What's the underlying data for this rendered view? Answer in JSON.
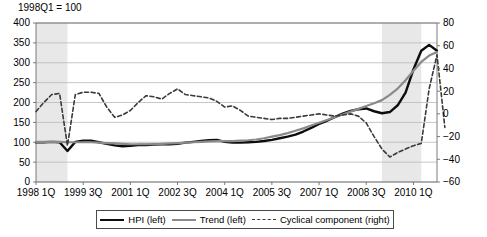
{
  "chart_data": {
    "type": "line",
    "title": "1998Q1 = 100",
    "xlabel": "",
    "ylabel": "",
    "grid": true,
    "legend_position": "bottom",
    "y_left": {
      "label": "index (1998Q1 = 100)",
      "ticks": [
        0,
        50,
        100,
        150,
        200,
        250,
        300,
        350,
        400
      ],
      "ylim": [
        0,
        400
      ]
    },
    "y_right": {
      "label": "percent deviation",
      "ticks": [
        -60,
        -40,
        -20,
        0,
        20,
        40,
        60,
        80
      ],
      "ylim": [
        -60,
        80
      ]
    },
    "x_tick_labels": [
      "1998 1Q",
      "1999 3Q",
      "2001 1Q",
      "2002 3Q",
      "2004 1Q",
      "2005 3Q",
      "2007 1Q",
      "2008 3Q",
      "2010 1Q"
    ],
    "x_tick_periods": [
      "1998Q1",
      "1999Q3",
      "2001Q1",
      "2002Q3",
      "2004Q1",
      "2005Q3",
      "2007Q1",
      "2008Q3",
      "2010Q1"
    ],
    "x_range": [
      "1998Q1",
      "2010Q4"
    ],
    "shaded_regions": [
      {
        "from": "1998Q1",
        "to": "1999Q1",
        "color": "#e8e8e8"
      },
      {
        "from": "2009Q1",
        "to": "2010Q2",
        "color": "#e8e8e8"
      }
    ],
    "periods": [
      "1998Q1",
      "1998Q2",
      "1998Q3",
      "1998Q4",
      "1999Q1",
      "1999Q2",
      "1999Q3",
      "1999Q4",
      "2000Q1",
      "2000Q2",
      "2000Q3",
      "2000Q4",
      "2001Q1",
      "2001Q2",
      "2001Q3",
      "2001Q4",
      "2002Q1",
      "2002Q2",
      "2002Q3",
      "2002Q4",
      "2003Q1",
      "2003Q2",
      "2003Q3",
      "2003Q4",
      "2004Q1",
      "2004Q2",
      "2004Q3",
      "2004Q4",
      "2005Q1",
      "2005Q2",
      "2005Q3",
      "2005Q4",
      "2006Q1",
      "2006Q2",
      "2006Q3",
      "2006Q4",
      "2007Q1",
      "2007Q2",
      "2007Q3",
      "2007Q4",
      "2008Q1",
      "2008Q2",
      "2008Q3",
      "2008Q4",
      "2009Q1",
      "2009Q2",
      "2009Q3",
      "2009Q4",
      "2010Q1",
      "2010Q2",
      "2010Q3",
      "2010Q4"
    ],
    "series": [
      {
        "name": "HPI (left)",
        "axis": "left",
        "style": "solid",
        "color": "#0d0d0d",
        "width": 2.4,
        "values": [
          100,
          100,
          101,
          100,
          78,
          101,
          104,
          104,
          100,
          96,
          92,
          90,
          91,
          93,
          93,
          94,
          95,
          95,
          96,
          99,
          101,
          103,
          105,
          106,
          101,
          99,
          99,
          100,
          101,
          103,
          106,
          110,
          114,
          119,
          127,
          136,
          146,
          154,
          163,
          172,
          179,
          183,
          185,
          178,
          173,
          176,
          193,
          225,
          283,
          330,
          345,
          330
        ]
      },
      {
        "name": "Trend (left)",
        "axis": "left",
        "style": "solid",
        "color": "#8a8a8a",
        "width": 2.2,
        "values": [
          101,
          101,
          101,
          101,
          100,
          100,
          100,
          100,
          99,
          98,
          97,
          96,
          95,
          95,
          95,
          95,
          96,
          97,
          98,
          99,
          100,
          101,
          102,
          103,
          103,
          103,
          104,
          105,
          107,
          110,
          114,
          118,
          123,
          129,
          135,
          142,
          149,
          156,
          163,
          170,
          177,
          184,
          191,
          198,
          206,
          219,
          235,
          256,
          280,
          302,
          318,
          327
        ]
      },
      {
        "name": "Cyclical component (right)",
        "axis": "right",
        "style": "dashed",
        "color": "#3a3a3a",
        "width": 1.6,
        "values": [
          2,
          10,
          17,
          18,
          -28,
          17,
          19,
          19,
          18,
          6,
          -3,
          -1,
          3,
          10,
          16,
          15,
          13,
          18,
          22,
          17,
          16,
          15,
          14,
          11,
          6,
          7,
          3,
          -2,
          -3,
          -4,
          -5,
          -4,
          -4,
          -3,
          -2,
          -1,
          0,
          -1,
          -2,
          -1,
          0,
          -2,
          -8,
          -20,
          -31,
          -38,
          -34,
          -31,
          -28,
          -26,
          22,
          52,
          -12
        ]
      }
    ]
  },
  "legend": {
    "entries": [
      {
        "label": "HPI (left)",
        "swatch": "solid-black"
      },
      {
        "label": "Trend (left)",
        "swatch": "solid-gray"
      },
      {
        "label": "Cyclical component (right)",
        "swatch": "dashed-gray"
      }
    ]
  }
}
